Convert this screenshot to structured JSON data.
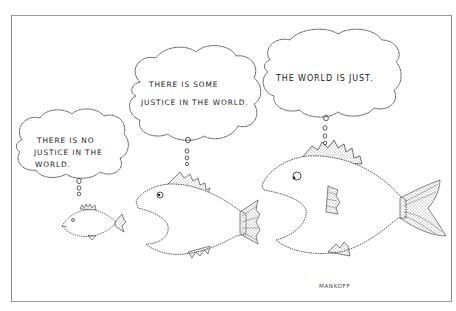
{
  "cartoon": {
    "artist_signature": "MANKOFF",
    "fish": [
      {
        "size": "small",
        "thought": {
          "lines": [
            "THERE IS NO",
            "JUSTICE IN THE",
            "WORLD."
          ]
        }
      },
      {
        "size": "medium",
        "thought": {
          "lines": [
            "THERE IS SOME",
            "JUSTICE IN THE WORLD."
          ]
        }
      },
      {
        "size": "large",
        "thought": {
          "lines": [
            "THE WORLD IS JUST."
          ]
        }
      }
    ],
    "colors": {
      "background": "#ffffff",
      "ink": "#1a1a1a",
      "frame": "#8a8a8a"
    }
  }
}
